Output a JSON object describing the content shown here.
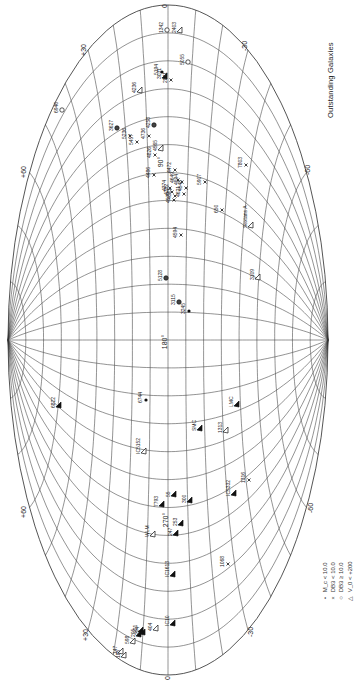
{
  "figure": {
    "title": "Outstanding Galaxies",
    "projection": "Aitoff (rotated 90°)",
    "colors": {
      "ink": "#222222",
      "grid": "#3a3a3a",
      "background": "#ffffff"
    }
  },
  "axes": {
    "longitude_labels": [
      {
        "text": "0",
        "x": 167,
        "y": 6
      },
      {
        "text": "90°",
        "x": 163,
        "y": 162
      },
      {
        "text": "180°",
        "x": 167,
        "y": 342
      },
      {
        "text": "270°",
        "x": 168,
        "y": 520
      },
      {
        "text": "0",
        "x": 170,
        "y": 678
      }
    ],
    "latitude_labels": [
      {
        "text": "+30",
        "x": 86,
        "y": 50
      },
      {
        "text": "+60",
        "x": 26,
        "y": 172
      },
      {
        "text": "-30",
        "x": 247,
        "y": 46
      },
      {
        "text": "-60",
        "x": 310,
        "y": 170
      },
      {
        "text": "+60",
        "x": 26,
        "y": 512
      },
      {
        "text": "-60",
        "x": 313,
        "y": 508
      },
      {
        "text": "+30",
        "x": 88,
        "y": 635
      },
      {
        "text": "-30",
        "x": 253,
        "y": 632
      }
    ]
  },
  "legend": {
    "items": [
      {
        "symbol": "•",
        "label": "M_c < 10.0"
      },
      {
        "symbol": "×",
        "label": "DB3 < 10.0"
      },
      {
        "symbol": "○",
        "label": "DB3 ≥ 10.0"
      },
      {
        "symbol": "△",
        "label": "V_0 < +200"
      }
    ]
  },
  "galaxies": [
    {
      "name": "1342",
      "marker": "open-circle",
      "x": 167,
      "y": 30
    },
    {
      "name": "6946",
      "marker": "open-circle",
      "x": 62,
      "y": 110
    },
    {
      "name": "5194",
      "marker": "filled-circle",
      "x": 162,
      "y": 72
    },
    {
      "name": "2403",
      "marker": "triangle-open",
      "x": 180,
      "y": 30
    },
    {
      "name": "3031",
      "marker": "triangle-filled",
      "x": 165,
      "y": 76
    },
    {
      "name": "2841",
      "marker": "x",
      "x": 171,
      "y": 80
    },
    {
      "name": "5055",
      "marker": "open-circle",
      "x": 188,
      "y": 62
    },
    {
      "name": "4236",
      "marker": "triangle-open",
      "x": 140,
      "y": 90
    },
    {
      "name": "3627",
      "marker": "circle-x",
      "x": 117,
      "y": 128
    },
    {
      "name": "5236",
      "marker": "x",
      "x": 130,
      "y": 136
    },
    {
      "name": "5457",
      "marker": "x",
      "x": 137,
      "y": 142
    },
    {
      "name": "4736",
      "marker": "x",
      "x": 149,
      "y": 136
    },
    {
      "name": "4258",
      "marker": "circle-x",
      "x": 154,
      "y": 125
    },
    {
      "name": "4826",
      "marker": "x",
      "x": 155,
      "y": 155
    },
    {
      "name": "4565",
      "marker": "triangle-open",
      "x": 161,
      "y": 148
    },
    {
      "name": "4486",
      "marker": "x",
      "x": 154,
      "y": 175
    },
    {
      "name": "4472",
      "marker": "x",
      "x": 175,
      "y": 170
    },
    {
      "name": "4649",
      "marker": "x",
      "x": 178,
      "y": 180
    },
    {
      "name": "4594",
      "marker": "x",
      "x": 182,
      "y": 182
    },
    {
      "name": "4374",
      "marker": "x",
      "x": 170,
      "y": 188
    },
    {
      "name": "4382",
      "marker": "x",
      "x": 172,
      "y": 192
    },
    {
      "name": "4501",
      "marker": "x",
      "x": 175,
      "y": 196
    },
    {
      "name": "4579",
      "marker": "x",
      "x": 174,
      "y": 200
    },
    {
      "name": "4548",
      "marker": "x",
      "x": 186,
      "y": 188
    },
    {
      "name": "4621",
      "marker": "x",
      "x": 184,
      "y": 194
    },
    {
      "name": "5907",
      "marker": "x",
      "x": 205,
      "y": 182
    },
    {
      "name": "7803",
      "marker": "x",
      "x": 246,
      "y": 165
    },
    {
      "name": "650",
      "marker": "x",
      "x": 222,
      "y": 210
    },
    {
      "name": "Sextans A",
      "marker": "triangle-open",
      "x": 251,
      "y": 225
    },
    {
      "name": "4594b",
      "marker": "x",
      "x": 181,
      "y": 235
    },
    {
      "name": "5128",
      "marker": "circle-x",
      "x": 166,
      "y": 278
    },
    {
      "name": "3115",
      "marker": "circle-x",
      "x": 179,
      "y": 302
    },
    {
      "name": "3245",
      "marker": "filled-circle",
      "x": 189,
      "y": 311
    },
    {
      "name": "3109",
      "marker": "triangle-open",
      "x": 258,
      "y": 277
    },
    {
      "name": "6822",
      "marker": "triangle-filled",
      "x": 59,
      "y": 405
    },
    {
      "name": "6744",
      "marker": "filled-circle",
      "x": 146,
      "y": 400
    },
    {
      "name": "LMC",
      "marker": "triangle-filled",
      "x": 237,
      "y": 404
    },
    {
      "name": "SMC",
      "marker": "triangle-filled",
      "x": 200,
      "y": 428
    },
    {
      "name": "1313",
      "marker": "triangle-open",
      "x": 226,
      "y": 430
    },
    {
      "name": "IC5152",
      "marker": "triangle-open",
      "x": 144,
      "y": 451
    },
    {
      "name": "55",
      "marker": "triangle-filled",
      "x": 174,
      "y": 494
    },
    {
      "name": "300",
      "marker": "triangle-filled",
      "x": 190,
      "y": 500
    },
    {
      "name": "7793",
      "marker": "triangle-filled",
      "x": 162,
      "y": 504
    },
    {
      "name": "IC5332",
      "marker": "triangle-filled",
      "x": 234,
      "y": 493
    },
    {
      "name": "1316",
      "marker": "x",
      "x": 249,
      "y": 480
    },
    {
      "name": "WLM",
      "marker": "triangle-open",
      "x": 153,
      "y": 534
    },
    {
      "name": "253",
      "marker": "triangle-filled",
      "x": 181,
      "y": 523
    },
    {
      "name": "247",
      "marker": "triangle-filled",
      "x": 176,
      "y": 533
    },
    {
      "name": "IC1613",
      "marker": "triangle-filled",
      "x": 173,
      "y": 574
    },
    {
      "name": "1068",
      "marker": "x",
      "x": 228,
      "y": 564
    },
    {
      "name": "IC10",
      "marker": "triangle-filled",
      "x": 173,
      "y": 623
    },
    {
      "name": "404",
      "marker": "triangle-open",
      "x": 156,
      "y": 628
    },
    {
      "name": "221",
      "marker": "triangle-filled",
      "x": 141,
      "y": 630
    },
    {
      "name": "224",
      "marker": "triangle-filled",
      "x": 143,
      "y": 632
    },
    {
      "name": "205",
      "marker": "triangle-filled",
      "x": 139,
      "y": 634
    },
    {
      "name": "598",
      "marker": "triangle-open",
      "x": 133,
      "y": 641
    },
    {
      "name": "185",
      "marker": "triangle-open",
      "x": 124,
      "y": 655
    },
    {
      "name": "147",
      "marker": "triangle-open",
      "x": 121,
      "y": 651
    }
  ]
}
